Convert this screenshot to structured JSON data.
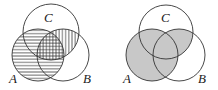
{
  "diagrams": [
    {
      "id": "left",
      "description": "A shaded with horizontal lines, B∩C shaded with vertical lines (crosshatch in A∩B∩C)",
      "labels": {
        "a": "A",
        "b": "B",
        "c": "C"
      },
      "fill_style": "hatched"
    },
    {
      "id": "right",
      "description": "A ∪ (B∩C) shaded gray",
      "labels": {
        "a": "A",
        "b": "B",
        "c": "C"
      },
      "fill_style": "gray",
      "fill_color": "#c8c8c8"
    }
  ],
  "colors": {
    "stroke": "#333333",
    "shade": "#c8c8c8",
    "background": "#ffffff"
  }
}
